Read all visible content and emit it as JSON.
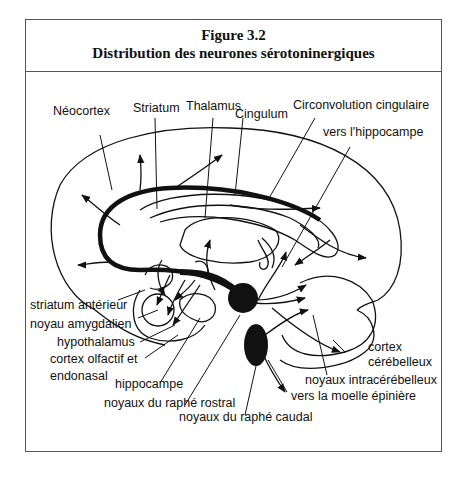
{
  "figure": {
    "number": "Figure 3.2",
    "title": "Distribution des neurones sérotoninergiques"
  },
  "labels": {
    "neocortex": "Néocortex",
    "striatum": "Striatum",
    "thalamus": "Thalamus",
    "cingulum": "Cingulum",
    "circonvolution_cingulaire": "Circonvolution cingulaire",
    "vers_hippocampe": "vers l'hippocampe",
    "striatum_anterieur": "striatum antérieur",
    "noyau_amygdalien": "noyau amygdalien",
    "hypothalamus": "hypothalamus",
    "cortex_olfactif_1": "cortex olfactif et",
    "cortex_olfactif_2": "endonasal",
    "hippocampe": "hippocampe",
    "raphe_rostral": "noyaux du raphé rostral",
    "raphe_caudal": "noyaux du raphé caudal",
    "cortex_cerebelleux_1": "cortex",
    "cortex_cerebelleux_2": "cérébelleux",
    "noyaux_intracerebelleux": "noyaux intracérébelleux",
    "vers_moelle": "vers la moelle épinière"
  },
  "colors": {
    "ink": "#111111",
    "frame": "#555555",
    "background": "#ffffff"
  }
}
